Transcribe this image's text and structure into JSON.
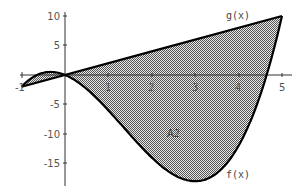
{
  "chart_data": {
    "type": "area",
    "title": "",
    "xlabel": "",
    "ylabel": "",
    "xlim": [
      -1,
      5
    ],
    "ylim": [
      -18.5,
      10.5
    ],
    "x_ticks": [
      1,
      2,
      3,
      4,
      5
    ],
    "x_tick_labels": [
      "1",
      "2",
      "3",
      "4",
      "5"
    ],
    "left_end_label": "-1",
    "y_ticks": [
      10,
      5,
      -5,
      -10,
      -15
    ],
    "y_tick_labels": [
      "10",
      "5",
      "-5",
      "-10",
      "-15"
    ],
    "grid": false,
    "series": [
      {
        "name": "f(x)",
        "formula": "x^3 - 4x^2 - 3x",
        "x": [
          -1,
          -0.5,
          0,
          1,
          2,
          3,
          4,
          4.7,
          5
        ],
        "values": [
          -2,
          0.375,
          0,
          -6,
          -14,
          -18,
          -12,
          0,
          10
        ]
      },
      {
        "name": "g(x)",
        "formula": "2x",
        "x": [
          -1,
          0,
          1,
          2,
          3,
          4,
          5
        ],
        "values": [
          -2,
          0,
          2,
          4,
          6,
          8,
          10
        ]
      }
    ],
    "shaded_regions": [
      {
        "label": "",
        "between": [
          "f(x)",
          "g(x)"
        ],
        "x_range": [
          -1,
          0
        ]
      },
      {
        "label": "A2",
        "between": [
          "f(x)",
          "g(x)"
        ],
        "x_range": [
          0,
          5
        ]
      }
    ],
    "annotations": [
      {
        "text": "g(x)",
        "x": 4.2,
        "y": 11
      },
      {
        "text": "f(x)",
        "x": 4.0,
        "y": -19
      },
      {
        "text": "A2",
        "x": 2.3,
        "y": -10
      }
    ]
  },
  "labels": {
    "g": "g(x)",
    "f": "f(x)",
    "area": "A2",
    "x1": "1",
    "x2": "2",
    "x3": "3",
    "x4": "4",
    "x5": "5",
    "xm1": "-1",
    "y10": "10",
    "y5": "5",
    "ym5": "-5",
    "ym10": "-10",
    "ym15": "-15"
  }
}
